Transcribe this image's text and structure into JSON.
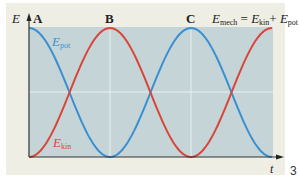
{
  "figure": {
    "axis_y_label": "E",
    "axis_x_label": "t",
    "points": [
      "A",
      "B",
      "C"
    ],
    "curve_pot": {
      "symbol": "E",
      "sub": "pot",
      "color": "#3b8fd0"
    },
    "curve_kin": {
      "symbol": "E",
      "sub": "kin",
      "color": "#d8453a"
    },
    "equation": {
      "lhs": "E",
      "lhs_sub": "mech",
      "eq": " = ",
      "t1": "E",
      "t1_sub": "kin",
      "plus": "+ ",
      "t2": "E",
      "t2_sub": "pot"
    },
    "page_number": "3",
    "colors": {
      "panel": "#eeeee5",
      "plot_bg": "#c5d5d7",
      "grid": "#e6eeee",
      "axis": "#333333"
    }
  },
  "chart_data": {
    "type": "line",
    "title": "",
    "xlabel": "t",
    "ylabel": "E",
    "x_markers": [
      {
        "label": "A",
        "x": 0
      },
      {
        "label": "B",
        "x": 0.5
      },
      {
        "label": "C",
        "x": 1.0
      }
    ],
    "x": [
      0,
      0.125,
      0.25,
      0.375,
      0.5,
      0.625,
      0.75,
      0.875,
      1.0,
      1.125,
      1.25,
      1.375,
      1.5
    ],
    "series": [
      {
        "name": "E_pot",
        "color": "#3b8fd0",
        "values": [
          1,
          0.854,
          0.5,
          0.146,
          0,
          0.146,
          0.5,
          0.854,
          1,
          0.854,
          0.5,
          0.146,
          0
        ]
      },
      {
        "name": "E_kin",
        "color": "#d8453a",
        "values": [
          0,
          0.146,
          0.5,
          0.854,
          1,
          0.854,
          0.5,
          0.146,
          0,
          0.146,
          0.5,
          0.854,
          1
        ]
      }
    ],
    "annotations": [
      "E_mech = E_kin + E_pot"
    ],
    "ylim": [
      0,
      1
    ],
    "xlim": [
      0,
      1.5
    ],
    "grid": true,
    "legend": "inline labels"
  }
}
